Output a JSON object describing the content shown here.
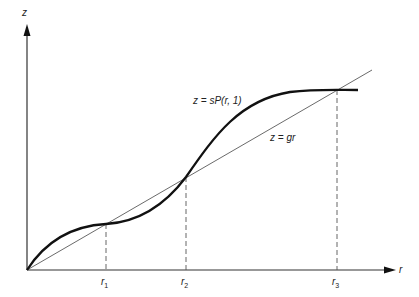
{
  "figure": {
    "axes": {
      "y_label": "z",
      "x_label": "r"
    },
    "curves": {
      "curve_label": "z = sP(r, 1)",
      "line_label": "z = gr"
    },
    "ticks": [
      {
        "name": "r",
        "sub": "1"
      },
      {
        "name": "r",
        "sub": "2"
      },
      {
        "name": "r",
        "sub": "3"
      }
    ]
  },
  "colors": {
    "ink": "#1a1a1a",
    "background": "#ffffff"
  }
}
